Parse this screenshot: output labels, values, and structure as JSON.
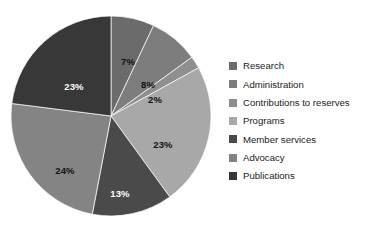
{
  "chart_data": {
    "type": "pie",
    "title": "",
    "subtitle": "",
    "xlabel": "",
    "ylabel": "",
    "legend_position": "right",
    "grid": false,
    "start_angle_deg": 0,
    "direction": "clockwise",
    "units": "percent",
    "categories": [
      "Research",
      "Administration",
      "Contributions to reserves",
      "Programs",
      "Member services",
      "Advocacy",
      "Publications"
    ],
    "values": [
      7,
      8,
      2,
      23,
      13,
      24,
      23
    ],
    "data_labels": [
      "7%",
      "8%",
      "2%",
      "23%",
      "13%",
      "24%",
      "23%"
    ],
    "colors": [
      "#6b6b6b",
      "#7d7d7d",
      "#8f8f8f",
      "#a8a8a8",
      "#4a4a4a",
      "#848484",
      "#383838"
    ],
    "label_text_colors": [
      "#111111",
      "#111111",
      "#111111",
      "#111111",
      "#ffffff",
      "#111111",
      "#ffffff"
    ],
    "slices": [
      {
        "label": "Research",
        "value": 7,
        "data_label": "7%",
        "color": "#6b6b6b",
        "label_color": "#111111",
        "label_x": 120,
        "label_y": 50
      },
      {
        "label": "Administration",
        "value": 8,
        "data_label": "8%",
        "color": "#7d7d7d",
        "label_color": "#111111",
        "label_x": 140,
        "label_y": 73
      },
      {
        "label": "Contributions to reserves",
        "value": 2,
        "data_label": "2%",
        "color": "#8f8f8f",
        "label_color": "#111111",
        "label_x": 147,
        "label_y": 88
      },
      {
        "label": "Programs",
        "value": 23,
        "data_label": "23%",
        "color": "#a8a8a8",
        "label_color": "#111111",
        "label_x": 155,
        "label_y": 133
      },
      {
        "label": "Member services",
        "value": 13,
        "data_label": "13%",
        "color": "#4a4a4a",
        "label_color": "#ffffff",
        "label_x": 112,
        "label_y": 182
      },
      {
        "label": "Advocacy",
        "value": 24,
        "data_label": "24%",
        "color": "#848484",
        "label_color": "#111111",
        "label_x": 57,
        "label_y": 159
      },
      {
        "label": "Publications",
        "value": 23,
        "data_label": "23%",
        "color": "#383838",
        "label_color": "#ffffff",
        "label_x": 66,
        "label_y": 75
      }
    ]
  },
  "legend": {
    "items": [
      {
        "label": "Research",
        "color": "#6b6b6b"
      },
      {
        "label": "Administration",
        "color": "#7d7d7d"
      },
      {
        "label": "Contributions to reserves",
        "color": "#8f8f8f"
      },
      {
        "label": "Programs",
        "color": "#a8a8a8"
      },
      {
        "label": "Member services",
        "color": "#4a4a4a"
      },
      {
        "label": "Advocacy",
        "color": "#848484"
      },
      {
        "label": "Publications",
        "color": "#383838"
      }
    ]
  },
  "geometry": {
    "center_x": 103,
    "center_y": 104,
    "radius": 100
  }
}
